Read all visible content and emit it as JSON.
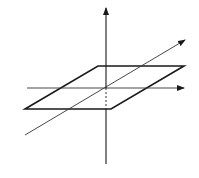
{
  "diagram": {
    "title": "",
    "colors": {
      "background": "#ffffff",
      "stroke": "#1a1a1a",
      "thin_stroke": "#333333"
    },
    "elements": {
      "vertical_axis": {
        "x": 106,
        "y1": 164,
        "y2": 8,
        "arrow": "up"
      },
      "horizontal_axis": {
        "y": 88,
        "x1": 27,
        "x2": 184,
        "arrow": "right"
      },
      "diagonal_line": {
        "x1": 25,
        "y1": 135,
        "x2": 185,
        "y2": 40,
        "arrow": "up-right"
      },
      "plane": {
        "points": [
          [
            25,
            109
          ],
          [
            98,
            66
          ],
          [
            184,
            66
          ],
          [
            111,
            109
          ]
        ]
      },
      "hidden_segment": {
        "x": 106,
        "y1": 88,
        "y2": 109,
        "style": "dashed"
      }
    },
    "labels": []
  }
}
